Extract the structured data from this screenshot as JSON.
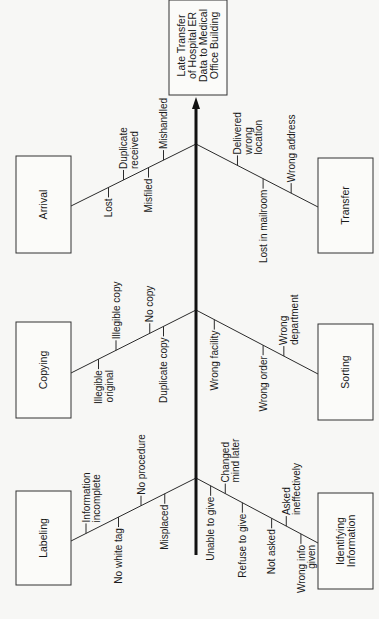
{
  "diagram": {
    "type": "fishbone",
    "orientation": "rotated-90-ccw",
    "effect": {
      "lines": [
        "Late Transfer",
        "of Hospital ER",
        "Data to Medical",
        "Office Building"
      ],
      "box": {
        "x": 169,
        "y": 0,
        "w": 58,
        "h": 95
      }
    },
    "spine": {
      "x": 196,
      "y_bottom": 555,
      "y_tip": 97
    },
    "categories": [
      {
        "id": "arrival",
        "label": [
          "Arrival"
        ],
        "side": "left",
        "box": {
          "x": 16,
          "y": 156,
          "w": 55,
          "h": 97
        },
        "bone": {
          "x1": 71,
          "y1": 206,
          "x2": 196,
          "y2": 144
        },
        "causes": [
          {
            "lines": [
              "Lost"
            ],
            "side": "below",
            "t": 0.3
          },
          {
            "lines": [
              "Duplicate",
              "received"
            ],
            "side": "above",
            "t": 0.42
          },
          {
            "lines": [
              "Misfiled"
            ],
            "side": "below",
            "t": 0.62
          },
          {
            "lines": [
              "Mishandled"
            ],
            "side": "above",
            "t": 0.74
          }
        ]
      },
      {
        "id": "copying",
        "label": [
          "Copying"
        ],
        "side": "left",
        "box": {
          "x": 16,
          "y": 322,
          "w": 55,
          "h": 96
        },
        "bone": {
          "x1": 71,
          "y1": 373,
          "x2": 196,
          "y2": 310
        },
        "causes": [
          {
            "lines": [
              "Illegible",
              "original"
            ],
            "side": "below",
            "t": 0.22
          },
          {
            "lines": [
              "Illegible  copy"
            ],
            "side": "above",
            "t": 0.36
          },
          {
            "lines": [
              "No copy"
            ],
            "side": "above",
            "t": 0.63
          },
          {
            "lines": [
              "Duplicate copy"
            ],
            "side": "below",
            "t": 0.74
          }
        ]
      },
      {
        "id": "labeling",
        "label": [
          "Labeling"
        ],
        "side": "left",
        "box": {
          "x": 16,
          "y": 491,
          "w": 55,
          "h": 94
        },
        "bone": {
          "x1": 71,
          "y1": 541,
          "x2": 196,
          "y2": 478
        },
        "causes": [
          {
            "lines": [
              "Information",
              "incomplete"
            ],
            "side": "above",
            "t": 0.12
          },
          {
            "lines": [
              "No white tag"
            ],
            "side": "below",
            "t": 0.38
          },
          {
            "lines": [
              "No procedure"
            ],
            "side": "above",
            "t": 0.56
          },
          {
            "lines": [
              "Misplaced"
            ],
            "side": "below",
            "t": 0.75
          }
        ]
      },
      {
        "id": "transfer",
        "label": [
          "Transfer"
        ],
        "side": "right",
        "box": {
          "x": 318,
          "y": 158,
          "w": 55,
          "h": 95
        },
        "bone": {
          "x1": 196,
          "y1": 144,
          "x2": 318,
          "y2": 207
        },
        "causes": [
          {
            "lines": [
              "Delivered",
              "wrong",
              "location"
            ],
            "side": "above",
            "t": 0.34
          },
          {
            "lines": [
              "Lost in mailroom"
            ],
            "side": "below",
            "t": 0.55
          },
          {
            "lines": [
              "Wrong address"
            ],
            "side": "above",
            "t": 0.78
          }
        ]
      },
      {
        "id": "sorting",
        "label": [
          "Sorting"
        ],
        "side": "right",
        "box": {
          "x": 318,
          "y": 324,
          "w": 55,
          "h": 96
        },
        "bone": {
          "x1": 196,
          "y1": 310,
          "x2": 318,
          "y2": 374
        },
        "causes": [
          {
            "lines": [
              "Wrong facility"
            ],
            "side": "below",
            "t": 0.15
          },
          {
            "lines": [
              "Wrong order"
            ],
            "side": "below",
            "t": 0.55
          },
          {
            "lines": [
              "Wrong",
              "department"
            ],
            "side": "above",
            "t": 0.72
          }
        ]
      },
      {
        "id": "identifying-information",
        "label": [
          "Identifying",
          "Information"
        ],
        "side": "right",
        "box": {
          "x": 318,
          "y": 493,
          "w": 55,
          "h": 96
        },
        "bone": {
          "x1": 196,
          "y1": 478,
          "x2": 318,
          "y2": 543
        },
        "causes": [
          {
            "lines": [
              "Unable to give"
            ],
            "side": "below",
            "t": 0.12
          },
          {
            "lines": [
              "Changed",
              "mind later"
            ],
            "side": "above",
            "t": 0.24
          },
          {
            "lines": [
              "Refuse to give"
            ],
            "side": "below",
            "t": 0.38
          },
          {
            "lines": [
              "Not asked"
            ],
            "side": "below",
            "t": 0.62
          },
          {
            "lines": [
              "Asked",
              "ineffectively"
            ],
            "side": "above",
            "t": 0.74
          },
          {
            "lines": [
              "Wrong info",
              "given"
            ],
            "side": "below",
            "t": 0.86
          }
        ]
      }
    ]
  }
}
